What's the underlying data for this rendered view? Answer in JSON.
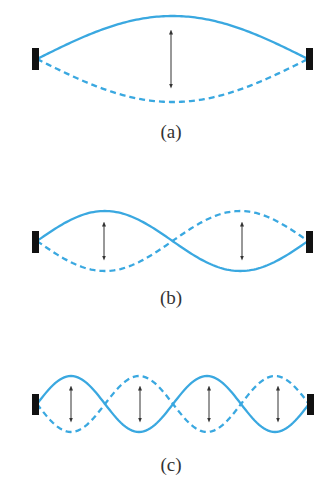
{
  "colors": {
    "string": "#3aa8e0",
    "support": "#111111",
    "arrow": "#333333",
    "label": "#333333",
    "background": "#ffffff"
  },
  "panels": [
    {
      "id": "a",
      "label": "(a)",
      "harmonic": 1,
      "loops": 1,
      "center_y": 59,
      "amplitude": 43,
      "x_start": 37,
      "x_end": 308,
      "arrows_x": [
        171
      ],
      "arrow_half_length": 27,
      "label_y": 132,
      "support_top": 48,
      "support_bottom": 70
    },
    {
      "id": "b",
      "label": "(b)",
      "harmonic": 2,
      "loops": 2,
      "center_y": 241,
      "amplitude": 30,
      "x_start": 37,
      "x_end": 308,
      "arrows_x": [
        104,
        242
      ],
      "arrow_half_length": 17,
      "label_y": 298,
      "support_top": 231,
      "support_bottom": 253
    },
    {
      "id": "c",
      "label": "(c)",
      "harmonic": 4,
      "loops": 4,
      "center_y": 404,
      "amplitude": 28,
      "x_start": 37,
      "x_end": 309,
      "arrows_x": [
        71,
        140,
        209,
        278
      ],
      "arrow_half_length": 16,
      "label_y": 465,
      "support_top": 394,
      "support_bottom": 415
    }
  ]
}
